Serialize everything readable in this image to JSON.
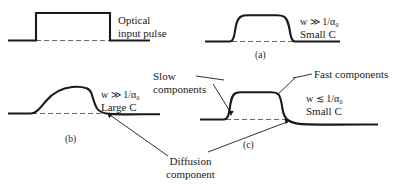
{
  "figure": {
    "background_color": "#ffffff",
    "line_color": "#1a1a1a",
    "dashed_color": "#6b6b6b"
  },
  "input_panel": {
    "label_line1": "Optical",
    "label_line2": "input pulse"
  },
  "panels": [
    {
      "id": "a",
      "caption": "(a)",
      "condition_var": "w",
      "condition_rel": "≫",
      "condition_value_num": "1",
      "condition_value_den": "α",
      "condition_value_sub": "0",
      "condition_text": "w ≫ 1/α₀",
      "capacitance_label": "Small C",
      "capacitance_prefix": "Small ",
      "capacitance_symbol": "C"
    },
    {
      "id": "b",
      "caption": "(b)",
      "condition_var": "w",
      "condition_rel": "≫",
      "condition_value_num": "1",
      "condition_value_den": "α",
      "condition_value_sub": "0",
      "condition_text": "w ≫ 1/α₀",
      "capacitance_label": "Large C",
      "capacitance_prefix": "Large ",
      "capacitance_symbol": "C"
    },
    {
      "id": "c",
      "caption": "(c)",
      "condition_var": "w",
      "condition_rel": "≲",
      "condition_value_num": "1",
      "condition_value_den": "α",
      "condition_value_sub": "0",
      "condition_text": "w ≲ 1/α₀",
      "capacitance_label": "Small C",
      "capacitance_prefix": "Small ",
      "capacitance_symbol": "C"
    }
  ],
  "annotations": {
    "slow_components_line1": "Slow",
    "slow_components_line2": "components",
    "fast_components": "Fast components",
    "diffusion_line1": "Diffusion",
    "diffusion_line2": "component"
  }
}
